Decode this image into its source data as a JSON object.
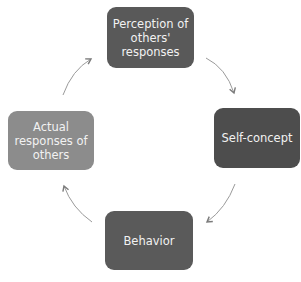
{
  "diagram": {
    "type": "cycle",
    "nodes": [
      {
        "id": "perception",
        "label": "Perception of others' responses",
        "lines": [
          "Perception of",
          "others'",
          "responses"
        ],
        "color": "#595959"
      },
      {
        "id": "self_concept",
        "label": "Self-concept",
        "lines": [
          "Self-concept"
        ],
        "color": "#4d4d4d"
      },
      {
        "id": "behavior",
        "label": "Behavior",
        "lines": [
          "Behavior"
        ],
        "color": "#5a5a5a"
      },
      {
        "id": "actual_responses",
        "label": "Actual responses of others",
        "lines": [
          "Actual",
          "responses of",
          "others"
        ],
        "color": "#8c8c8c"
      }
    ],
    "edges": [
      {
        "from": "perception",
        "to": "self_concept"
      },
      {
        "from": "self_concept",
        "to": "behavior"
      },
      {
        "from": "behavior",
        "to": "actual_responses"
      },
      {
        "from": "actual_responses",
        "to": "perception"
      }
    ],
    "arrow_color": "#8a8a8a"
  }
}
